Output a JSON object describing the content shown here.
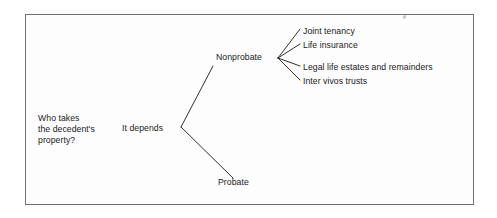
{
  "figure": {
    "kind": "tree-diagram",
    "border_color": "#6f6f6f",
    "line_color": "#1a1a1a",
    "text_color": "#1a1a1a",
    "background_color": "#fdfdfd"
  },
  "root": {
    "question_line_1": "Who takes",
    "question_line_2": "the decedent's",
    "question_line_3": "property?",
    "answer_label": "It depends"
  },
  "branches": [
    {
      "label": "Nonprobate"
    },
    {
      "label": "Probate"
    }
  ],
  "nonprobate_children": [
    {
      "label": "Joint tenancy"
    },
    {
      "label": "Life insurance"
    },
    {
      "label": "Legal life estates and remainders"
    },
    {
      "label": "Inter vivos trusts"
    }
  ],
  "artifacts": {
    "speck": "scan-speck"
  }
}
